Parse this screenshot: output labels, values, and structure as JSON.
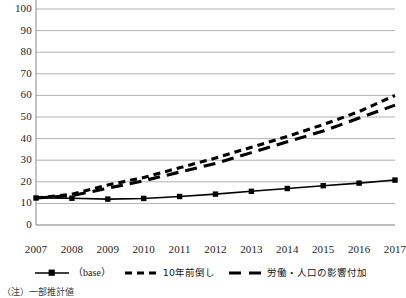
{
  "chart_data": {
    "type": "line",
    "title": "",
    "subtitle": "",
    "xlabel": "",
    "ylabel": "",
    "categories": [
      "2007",
      "2008",
      "2009",
      "2010",
      "2011",
      "2012",
      "2013",
      "2014",
      "2015",
      "2016",
      "2017"
    ],
    "x": [
      2007,
      2008,
      2009,
      2010,
      2011,
      2012,
      2013,
      2014,
      2015,
      2016,
      2017
    ],
    "ylim": [
      0,
      100
    ],
    "yticks": [
      0,
      10,
      20,
      30,
      40,
      50,
      60,
      70,
      80,
      90,
      100
    ],
    "ytick_labels": [
      "0",
      "10",
      "20",
      "30",
      "40",
      "50",
      "60",
      "70",
      "80",
      "90",
      "100"
    ],
    "grid": "horizontal",
    "legend_position": "bottom",
    "series": [
      {
        "name": "(base)",
        "style": "solid",
        "marker": "square",
        "color": "#000000",
        "values": [
          12.5,
          12.4,
          12.0,
          12.3,
          13.2,
          14.3,
          15.6,
          16.9,
          18.2,
          19.4,
          20.8
        ]
      },
      {
        "name": "10年前倒し",
        "style": "dashed-short",
        "marker": "none",
        "color": "#000000",
        "values": [
          12.5,
          14.2,
          18.5,
          22.0,
          26.5,
          31.0,
          36.0,
          41.0,
          46.5,
          52.5,
          60.0
        ]
      },
      {
        "name": "労働・人口の影響付加",
        "style": "dashed-long",
        "marker": "none",
        "color": "#000000",
        "values": [
          12.5,
          13.6,
          17.0,
          20.5,
          24.5,
          28.5,
          33.5,
          38.5,
          43.5,
          49.5,
          55.5
        ]
      }
    ]
  },
  "axes": {
    "ytick_labels": [
      "100",
      "90",
      "80",
      "70",
      "60",
      "50",
      "40",
      "30",
      "20",
      "10",
      "0"
    ],
    "xtick_labels": [
      "2007",
      "2008",
      "2009",
      "2010",
      "2011",
      "2012",
      "2013",
      "2014",
      "2015",
      "2016",
      "2017"
    ]
  },
  "legend": {
    "items": [
      {
        "label": "（base）",
        "style": "solid-marker"
      },
      {
        "label": "10年前倒し",
        "style": "dashed-short"
      },
      {
        "label": "労働・人口の影響付加",
        "style": "dashed-long"
      }
    ]
  },
  "footnote": {
    "text": "（注）一部推計値"
  }
}
